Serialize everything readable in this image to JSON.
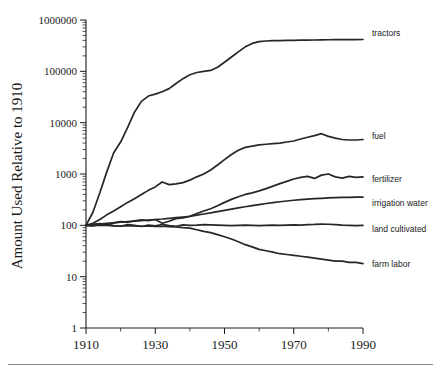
{
  "chart_data": {
    "type": "line",
    "title": "",
    "subtitle": "",
    "xlabel": "",
    "ylabel": "Amount Used Relative to 1910",
    "xlim": [
      1910,
      1990
    ],
    "ylim": [
      1,
      1000000
    ],
    "yscale": "log",
    "grid": false,
    "legend_position": "right-of-axes-inline-labels",
    "xticks": [
      1910,
      1930,
      1950,
      1970,
      1990
    ],
    "xtick_labels": [
      "1910",
      "1930",
      "1950",
      "1970",
      "1990"
    ],
    "xminor_ticks": [
      1920,
      1940,
      1960,
      1980
    ],
    "yticks": [
      1,
      10,
      100,
      1000,
      10000,
      100000,
      1000000
    ],
    "ytick_labels": [
      "1",
      "10",
      "100",
      "1000",
      "10000",
      "100000",
      "1000000"
    ],
    "x": [
      1910,
      1912,
      1914,
      1916,
      1918,
      1920,
      1922,
      1924,
      1926,
      1928,
      1930,
      1932,
      1934,
      1936,
      1938,
      1940,
      1942,
      1944,
      1946,
      1948,
      1950,
      1952,
      1954,
      1956,
      1958,
      1960,
      1962,
      1964,
      1966,
      1968,
      1970,
      1972,
      1974,
      1976,
      1978,
      1980,
      1982,
      1984,
      1986,
      1988,
      1990
    ],
    "series": [
      {
        "name": "tractors",
        "label": "tractors",
        "values": [
          100,
          180,
          430,
          1100,
          2600,
          4200,
          8000,
          16000,
          26000,
          33000,
          36000,
          40000,
          46000,
          58000,
          72000,
          86000,
          95000,
          100000,
          104000,
          120000,
          150000,
          190000,
          240000,
          300000,
          350000,
          380000,
          390000,
          395000,
          398000,
          400000,
          402000,
          404000,
          406000,
          408000,
          410000,
          412000,
          413000,
          414000,
          415000,
          416000,
          417000
        ]
      },
      {
        "name": "fuel",
        "label": "fuel",
        "values": [
          100,
          110,
          130,
          160,
          190,
          230,
          280,
          330,
          400,
          480,
          560,
          700,
          620,
          640,
          680,
          760,
          880,
          1000,
          1200,
          1500,
          1900,
          2400,
          2900,
          3300,
          3500,
          3700,
          3800,
          3900,
          4000,
          4200,
          4400,
          4800,
          5200,
          5600,
          6100,
          5400,
          5000,
          4700,
          4600,
          4600,
          4700
        ]
      },
      {
        "name": "fertilizer",
        "label": "fertilizer",
        "values": [
          100,
          104,
          108,
          105,
          112,
          118,
          115,
          122,
          128,
          124,
          130,
          110,
          120,
          135,
          140,
          150,
          170,
          190,
          210,
          240,
          280,
          320,
          360,
          400,
          430,
          470,
          520,
          580,
          650,
          720,
          800,
          860,
          900,
          820,
          950,
          1000,
          880,
          830,
          900,
          860,
          880
        ]
      },
      {
        "name": "irrigation water",
        "label": "irrigation water",
        "values": [
          100,
          103,
          106,
          109,
          112,
          115,
          118,
          121,
          124,
          127,
          130,
          133,
          137,
          141,
          145,
          150,
          158,
          166,
          175,
          185,
          196,
          207,
          218,
          230,
          242,
          254,
          266,
          278,
          288,
          298,
          308,
          316,
          324,
          330,
          336,
          342,
          346,
          350,
          352,
          354,
          356
        ]
      },
      {
        "name": "land cultivated",
        "label": "land cultivated",
        "values": [
          100,
          98,
          102,
          105,
          99,
          96,
          103,
          100,
          95,
          101,
          98,
          104,
          99,
          96,
          102,
          100,
          101,
          103,
          102,
          101,
          100,
          99,
          100,
          101,
          100,
          99,
          100,
          101,
          100,
          101,
          102,
          101,
          103,
          104,
          106,
          105,
          103,
          101,
          100,
          99,
          100
        ]
      },
      {
        "name": "farm labor",
        "label": "farm labor",
        "values": [
          100,
          99,
          101,
          100,
          98,
          97,
          99,
          98,
          96,
          97,
          95,
          96,
          94,
          93,
          90,
          88,
          82,
          76,
          72,
          66,
          60,
          54,
          48,
          42,
          38,
          34,
          32,
          30,
          28,
          27,
          26,
          25,
          24,
          23,
          22,
          21,
          20,
          20,
          19,
          19,
          18
        ]
      }
    ]
  }
}
